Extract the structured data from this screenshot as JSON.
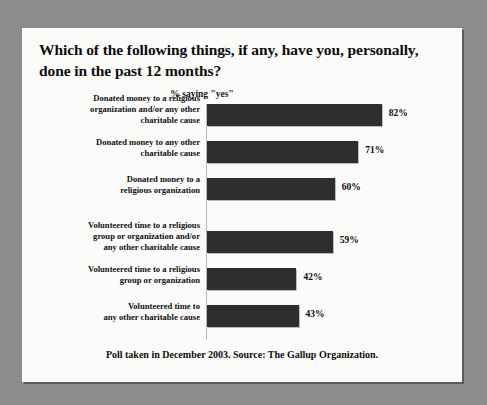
{
  "card": {
    "title": "Which of the following things, if any, have you, personally, done in the past 12 months?",
    "subtitle": "% saying \"yes\"",
    "footer": "Poll taken in December 2003. Source: The Gallup Organization."
  },
  "chart_data": {
    "type": "bar",
    "orientation": "horizontal",
    "title": "Which of the following things, if any, have you, personally, done in the past 12 months?",
    "subtitle": "% saying \"yes\"",
    "xlabel": "",
    "ylabel": "",
    "xlim": [
      0,
      100
    ],
    "grid": false,
    "legend": false,
    "bar_color": "#2e2e2e",
    "value_suffix": "%",
    "categories": [
      "Donated money to a religious organization and/or any other charitable cause",
      "Donated money to any other charitable cause",
      "Donated money to a religious organization",
      "Volunteered time to a religious group or organization and/or any other charitable cause",
      "Volunteered time to a religious group or organization",
      "Volunteered time to any other charitable cause"
    ],
    "values": [
      82,
      71,
      60,
      59,
      42,
      43
    ],
    "value_labels": [
      "82%",
      "71%",
      "60%",
      "59%",
      "42%",
      "43%"
    ],
    "bars": [
      {
        "label_lines": [
          "Donated money to a religious",
          "organization and/or any other",
          "charitable cause"
        ],
        "value": 82,
        "value_label": "82%",
        "group": 1
      },
      {
        "label_lines": [
          "Donated money to any other",
          "charitable cause"
        ],
        "value": 71,
        "value_label": "71%",
        "group": 1
      },
      {
        "label_lines": [
          "Donated money to a",
          "religious organization"
        ],
        "value": 60,
        "value_label": "60%",
        "group": 1
      },
      {
        "label_lines": [
          "Volunteered time to a religious",
          "group or organization and/or",
          "any other charitable cause"
        ],
        "value": 59,
        "value_label": "59%",
        "group": 2
      },
      {
        "label_lines": [
          "Volunteered time to a religious",
          "group or organization"
        ],
        "value": 42,
        "value_label": "42%",
        "group": 2
      },
      {
        "label_lines": [
          "Volunteered time to",
          "any other charitable cause"
        ],
        "value": 43,
        "value_label": "43%",
        "group": 2
      }
    ]
  },
  "style": {
    "background": "#8c8c8c",
    "card_background": "#fbfbfa",
    "bar_color": "#2e2e2e",
    "text_color": "#0d0d0d"
  }
}
